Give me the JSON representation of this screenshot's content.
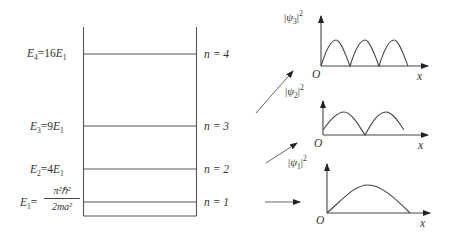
{
  "diagram": {
    "type": "infinite-square-well-energy-levels",
    "levels": [
      {
        "n_label": "n = 4",
        "energy_symbol": "E",
        "energy_sub": "4",
        "energy_value": "=16",
        "energy_ref": "E",
        "energy_ref_sub": "1",
        "y": 54
      },
      {
        "n_label": "n = 3",
        "energy_symbol": "E",
        "energy_sub": "3",
        "energy_value": "=9",
        "energy_ref": "E",
        "energy_ref_sub": "1",
        "y": 126
      },
      {
        "n_label": "n = 2",
        "energy_symbol": "E",
        "energy_sub": "2",
        "energy_value": "=4",
        "energy_ref": "E",
        "energy_ref_sub": "1",
        "y": 169
      },
      {
        "n_label": "n = 1",
        "energy_symbol": "E",
        "energy_sub": "1",
        "energy_value": "=",
        "y": 202
      }
    ],
    "ground_formula": {
      "numerator": "π²ℏ²",
      "denominator": "2ma²"
    },
    "well": {
      "left_x": 83,
      "right_x": 196,
      "top_y": 27,
      "bottom_y": 216
    },
    "plots": [
      {
        "ylabel_psi": "ψ",
        "ylabel_sub": "3",
        "ylabel_sup": "2",
        "origin": "O",
        "xlabel": "x",
        "half_periods": 3
      },
      {
        "ylabel_psi": "ψ",
        "ylabel_sub": "2",
        "ylabel_sup": "2",
        "origin": "O",
        "xlabel": "x",
        "half_periods": 2
      },
      {
        "ylabel_psi": "ψ",
        "ylabel_sub": "1",
        "ylabel_sup": "2",
        "origin": "O",
        "xlabel": "x",
        "half_periods": 1
      }
    ],
    "colors": {
      "line": "#444444",
      "text": "#333333",
      "background": "#ffffff"
    }
  }
}
